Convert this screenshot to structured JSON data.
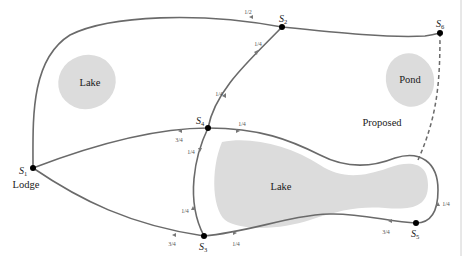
{
  "diagram": {
    "type": "network-map",
    "nodes": [
      {
        "id": "S1",
        "label": "S",
        "sub": "1",
        "x": 33,
        "y": 168,
        "place": "Lodge"
      },
      {
        "id": "S2",
        "label": "S",
        "sub": "2",
        "x": 282,
        "y": 27
      },
      {
        "id": "S3",
        "label": "S",
        "sub": "3",
        "x": 204,
        "y": 236
      },
      {
        "id": "S4",
        "label": "S",
        "sub": "4",
        "x": 208,
        "y": 128
      },
      {
        "id": "S5",
        "label": "S",
        "sub": "5",
        "x": 416,
        "y": 223
      },
      {
        "id": "S6",
        "label": "S",
        "sub": "6",
        "x": 440,
        "y": 33
      }
    ],
    "areas": [
      {
        "id": "lake-top-left",
        "label": "Lake"
      },
      {
        "id": "pond",
        "label": "Pond"
      },
      {
        "id": "lake-center",
        "label": "Lake"
      }
    ],
    "proposed_label": "Proposed",
    "place_label": "Lodge",
    "edge_fractions": {
      "s1_s2_top": "1/2",
      "s2_s4_a": "1/4",
      "s2_s4_b": "1/4",
      "s1_s4": "3/4",
      "s4_s5": "1/4",
      "s4_s3": "1/4",
      "s3_s4_loop": "1/4",
      "s1_s3": "3/4",
      "s3_s5": "1/4",
      "s5_s3_low": "3/4",
      "s5_loop": "1/4"
    },
    "edges": [
      {
        "from": "S1",
        "to": "S2",
        "fraction": "1/2"
      },
      {
        "from": "S2",
        "to": "S6"
      },
      {
        "from": "S2",
        "to": "S4",
        "fraction": "1/4"
      },
      {
        "from": "S1",
        "to": "S4",
        "fraction": "3/4"
      },
      {
        "from": "S4",
        "to": "S5",
        "fraction": "1/4"
      },
      {
        "from": "S4",
        "to": "S3",
        "fraction": "1/4"
      },
      {
        "from": "S1",
        "to": "S3",
        "fraction": "3/4"
      },
      {
        "from": "S3",
        "to": "S5",
        "fraction": "1/4"
      },
      {
        "from": "S6",
        "to": "S5",
        "style": "dashed",
        "label": "Proposed"
      }
    ]
  }
}
